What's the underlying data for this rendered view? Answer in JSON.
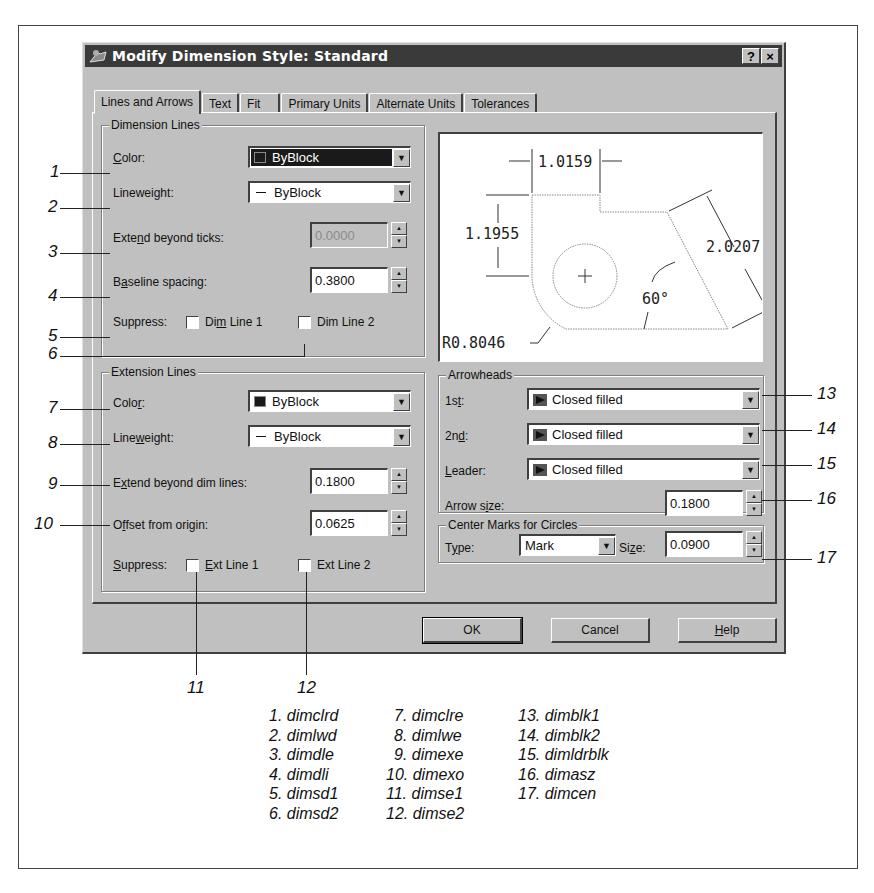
{
  "dialog": {
    "title": "Modify Dimension Style: Standard",
    "help_button": "?",
    "close_button": "×",
    "tabs": [
      {
        "label": "Lines and Arrows",
        "active": true
      },
      {
        "label": "Text"
      },
      {
        "label": "Fit"
      },
      {
        "label": "Primary Units"
      },
      {
        "label": "Alternate Units"
      },
      {
        "label": "Tolerances"
      }
    ],
    "dimension_lines": {
      "title": "Dimension Lines",
      "color_label_pre": "",
      "color_label_u": "C",
      "color_label_post": "olor:",
      "color_value": "ByBlock",
      "lineweight_label": "Lineweight:",
      "lineweight_value": "ByBlock",
      "extend_label_pre": "Exte",
      "extend_label_u": "n",
      "extend_label_post": "d beyond ticks:",
      "extend_value": "0.0000",
      "baseline_label_pre": "B",
      "baseline_label_u": "a",
      "baseline_label_post": "seline spacing:",
      "baseline_value": "0.3800",
      "suppress_label": "Suppress:",
      "dim_line1_pre": "Di",
      "dim_line1_u": "m",
      "dim_line1_post": " Line 1",
      "dim_line2": "Dim Line 2"
    },
    "extension_lines": {
      "title": "Extension Lines",
      "color_label_pre": "Colo",
      "color_label_u": "r",
      "color_label_post": ":",
      "color_value": "ByBlock",
      "lineweight_label_pre": "Line",
      "lineweight_label_u": "w",
      "lineweight_label_post": "eight:",
      "lineweight_value": "ByBlock",
      "extend_label_pre": "E",
      "extend_label_u": "x",
      "extend_label_post": "tend beyond dim lines:",
      "extend_value": "0.1800",
      "offset_label_pre": "O",
      "offset_label_u": "f",
      "offset_label_post": "fset from origin:",
      "offset_value": "0.0625",
      "suppress_label_u": "S",
      "suppress_label_post": "uppress:",
      "ext_line1_u": "E",
      "ext_line1_post": "xt Line 1",
      "ext_line2": "Ext Line 2"
    },
    "preview": {
      "dim_top": "1.0159",
      "dim_left": "1.1955",
      "dim_right": "2.0207",
      "angle": "60°",
      "radius": "R0.8046"
    },
    "arrowheads": {
      "title": "Arrowheads",
      "first_label_pre": "1s",
      "first_label_u": "t",
      "first_label_post": ":",
      "first_value": "Closed filled",
      "second_label_pre": "2n",
      "second_label_u": "d",
      "second_label_post": ":",
      "second_value": "Closed filled",
      "leader_label_u": "L",
      "leader_label_post": "eader:",
      "leader_value": "Closed filled",
      "size_label_pre": "Arrow s",
      "size_label_u": "i",
      "size_label_post": "ze:",
      "size_value": "0.1800"
    },
    "center_marks": {
      "title": "Center Marks for Circles",
      "type_label_pre": "T",
      "type_label_u": "y",
      "type_label_post": "pe:",
      "type_value": "Mark",
      "size_label_pre": "Si",
      "size_label_u": "z",
      "size_label_post": "e:",
      "size_value": "0.0900"
    },
    "buttons": {
      "ok": "OK",
      "cancel": "Cancel",
      "help_u": "H",
      "help_post": "elp"
    }
  },
  "callouts": {
    "n1": "1",
    "n2": "2",
    "n3": "3",
    "n4": "4",
    "n5": "5",
    "n6": "6",
    "n7": "7",
    "n8": "8",
    "n9": "9",
    "n10": "10",
    "n11": "11",
    "n12": "12",
    "n13": "13",
    "n14": "14",
    "n15": "15",
    "n16": "16",
    "n17": "17"
  },
  "legend": {
    "col1": [
      "1. dimclrd",
      "2. dimlwd",
      "3. dimdle",
      "4. dimdli",
      "5. dimsd1",
      "6. dimsd2"
    ],
    "col2": [
      "7. dimclre",
      "8. dimlwe",
      "9. dimexe",
      "10. dimexo",
      "11. dimse1",
      "12. dimse2"
    ],
    "col3": [
      "13. dimblk1",
      "14. dimblk2",
      "15. dimldrblk",
      "16. dimasz",
      "17. dimcen"
    ]
  }
}
